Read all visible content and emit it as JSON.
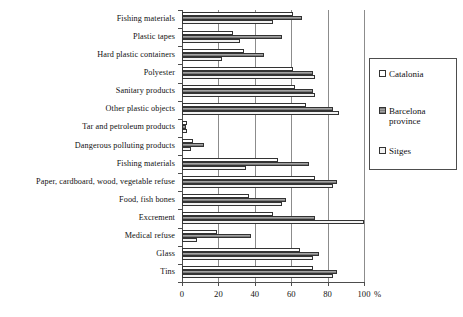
{
  "chart_data": {
    "type": "bar",
    "orientation": "horizontal",
    "title": "",
    "xlabel": "%",
    "ylabel": "",
    "xlim": [
      0,
      100
    ],
    "xticks": [
      0,
      20,
      40,
      60,
      80,
      100
    ],
    "xtick_labels": [
      "0",
      "20",
      "40",
      "60",
      "80",
      "100"
    ],
    "grid": true,
    "grid_axis": "x",
    "legend_position": "right",
    "categories": [
      "Fishing materials",
      "Plastic tapes",
      "Hard plastic containers",
      "Polyester",
      "Sanitary products",
      "Other plastic objects",
      "Tar and petroleum products",
      "Dangerous polluting products",
      "Fishing materials",
      "Paper, cardboard, wood, vegetable refuse",
      "Food, fish bones",
      "Excrement",
      "Medical refuse",
      "Glass",
      "Tins"
    ],
    "series": [
      {
        "name": "Catalonia",
        "color": "#ffffff",
        "values": [
          61,
          28,
          34,
          61,
          62,
          68,
          3,
          6,
          53,
          73,
          37,
          50,
          19,
          65,
          72
        ]
      },
      {
        "name": "Barcelona province",
        "color": "#8f8f8f",
        "values": [
          66,
          55,
          45,
          72,
          72,
          83,
          2,
          12,
          70,
          85,
          57,
          73,
          38,
          75,
          85
        ]
      },
      {
        "name": "Sitges",
        "color": "#f2f2f2",
        "values": [
          50,
          32,
          22,
          73,
          73,
          86,
          3,
          5,
          35,
          83,
          55,
          100,
          8,
          72,
          83
        ]
      }
    ]
  },
  "legend": {
    "entries": [
      {
        "label": "Catalonia",
        "icon": "legend-swatch-white"
      },
      {
        "label": "Barcelona\nprovince",
        "icon": "legend-swatch-gray"
      },
      {
        "label": "Sitges",
        "icon": "legend-swatch-light"
      }
    ]
  },
  "axis": {
    "unit_label": "%"
  }
}
